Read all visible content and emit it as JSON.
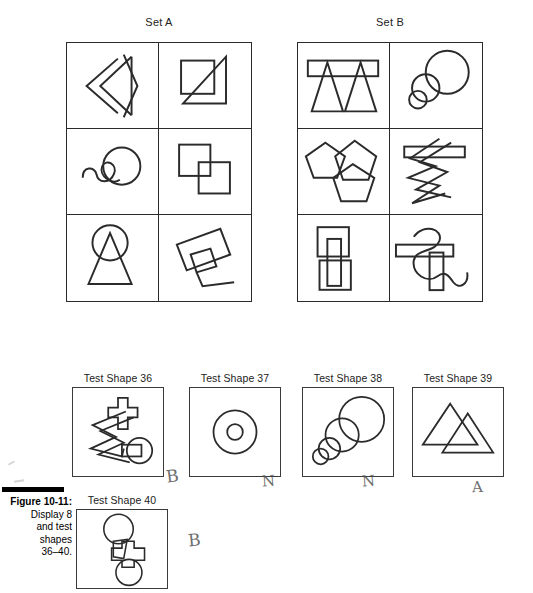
{
  "figure": {
    "caption_title": "Figure 10-11:",
    "caption_lines": [
      "Display 8",
      "and test",
      "shapes",
      "36–40."
    ]
  },
  "sets": [
    {
      "label": "Set A",
      "cells": [
        {
          "name": "nested-chevrons",
          "description": "Two nested chevron/arrow outlines pointing left with a vertical triangle"
        },
        {
          "name": "square-with-triangle",
          "description": "Square overlapped by a right triangle crossing diagonally"
        },
        {
          "name": "squiggle-with-circle",
          "description": "Wavy squiggly line looping through a circle"
        },
        {
          "name": "two-overlapping-squares",
          "description": "Two squares overlapping at the corners"
        },
        {
          "name": "circle-with-triangle",
          "description": "Circle with a tall triangle passing through it"
        },
        {
          "name": "tilted-rectangles",
          "description": "Tilted rectangle with a small quadrilateral and angled tail"
        }
      ]
    },
    {
      "label": "Set B",
      "cells": [
        {
          "name": "two-triangles-with-bar",
          "description": "Two triangles crossed by a horizontal rectangle bar"
        },
        {
          "name": "three-circles-chain",
          "description": "Large circle with two smaller overlapping circles"
        },
        {
          "name": "three-pentagons",
          "description": "Three overlapping pentagons"
        },
        {
          "name": "zigzag-with-bar",
          "description": "Zigzag lightning line crossed by a horizontal rectangle bar"
        },
        {
          "name": "squares-with-bar",
          "description": "Two squares linked by a vertical rectangle bar"
        },
        {
          "name": "snake-with-bars",
          "description": "Curved snake line crossed by horizontal and vertical bars"
        }
      ]
    }
  ],
  "test_shapes": [
    {
      "label": "Test Shape 36",
      "name": "zigzag-cross-circle",
      "answer_mark": "B"
    },
    {
      "label": "Test Shape 37",
      "name": "concentric-circles",
      "answer_mark": "N"
    },
    {
      "label": "Test Shape 38",
      "name": "four-graded-circles",
      "answer_mark": "N"
    },
    {
      "label": "Test Shape 39",
      "name": "two-overlapping-triangles",
      "answer_mark": "A"
    },
    {
      "label": "Test Shape 40",
      "name": "cross-with-two-circles",
      "answer_mark": "B"
    }
  ]
}
